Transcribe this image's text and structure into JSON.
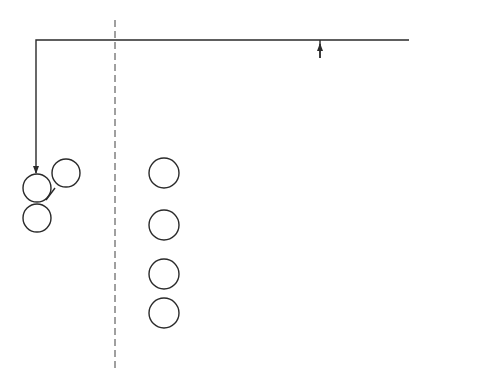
{
  "diagram": {
    "type": "state-flowchart",
    "regions": {
      "left": "Interrupt\nIndependent",
      "left_line1": "Interrupt",
      "left_line2": "Independent",
      "right_line1": "Interrupt",
      "right_line2": "Dependent"
    },
    "states": {
      "t1": "T1",
      "t2": "T2",
      "t1i": "T1I",
      "t3": "T3",
      "t4": "T4",
      "t5": "",
      "stopped": ""
    },
    "edge_labels": {
      "rdy": "RDY",
      "t3_cycle": "Cycle",
      "t3_ended": "Ended",
      "t4_cycle": "Cycle",
      "t4_ended": "Ended",
      "t5_cycle": "Cycle",
      "t5_name": "T5",
      "t5_ended": "Ended",
      "halt": "Halt",
      "stopped": "Stopped"
    },
    "decisions": {
      "jammed": {
        "lines": [
          "Was",
          "Instruction",
          "'Jammed'",
          "into",
          "CPU",
          "?"
        ],
        "yes": "Yes",
        "no": "No"
      },
      "complete": {
        "lines": [
          "Is",
          "Instruction",
          "Execution",
          "Complete",
          "?"
        ],
        "yes": "Yes",
        "no": "No"
      },
      "int": {
        "lines": [
          "Is",
          "INT = '1'",
          "?"
        ],
        "yes": "Yes",
        "no": "No"
      }
    },
    "colors": {
      "line": "#2a2a2a",
      "background": "#ffffff"
    }
  }
}
